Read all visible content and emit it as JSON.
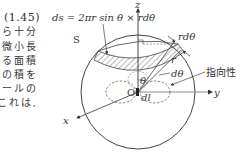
{
  "equation": {
    "number": "(1.45)",
    "formula": "ds = 2πr sin θ × rdθ"
  },
  "body_text_fragments": [
    "ら十分",
    "微小長",
    "る面積",
    "との積を",
    "ポールの",
    "これは,"
  ],
  "diagram": {
    "sphere_label": "S",
    "origin_label": "O",
    "axes": {
      "x": "x",
      "y": "y",
      "z": "z"
    },
    "labels": {
      "r_dtheta": "rdθ",
      "d_theta": "dθ",
      "radius": "r",
      "theta": "θ",
      "dipole_length": "dl",
      "directivity": "指向性"
    }
  }
}
